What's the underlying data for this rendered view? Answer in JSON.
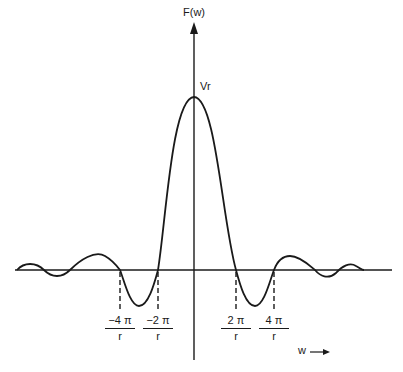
{
  "diagram": {
    "y_axis_label": "F(w)",
    "x_axis_label": "w",
    "peak_label": "Vr",
    "ticks": [
      {
        "numerator": "−4 π",
        "denominator": "r",
        "x": 120
      },
      {
        "numerator": "−2 π",
        "denominator": "r",
        "x": 158
      },
      {
        "numerator": "2 π",
        "denominator": "r",
        "x": 236
      },
      {
        "numerator": "4 π",
        "denominator": "r",
        "x": 274
      }
    ],
    "curve": "sinc-like function F(w) with main lobe peaking at Vr at w=0, zero crossings at ±2π/r and ±4π/r, decaying side lobes",
    "colors": {
      "ink": "#1a1a1a",
      "background": "#ffffff"
    }
  }
}
